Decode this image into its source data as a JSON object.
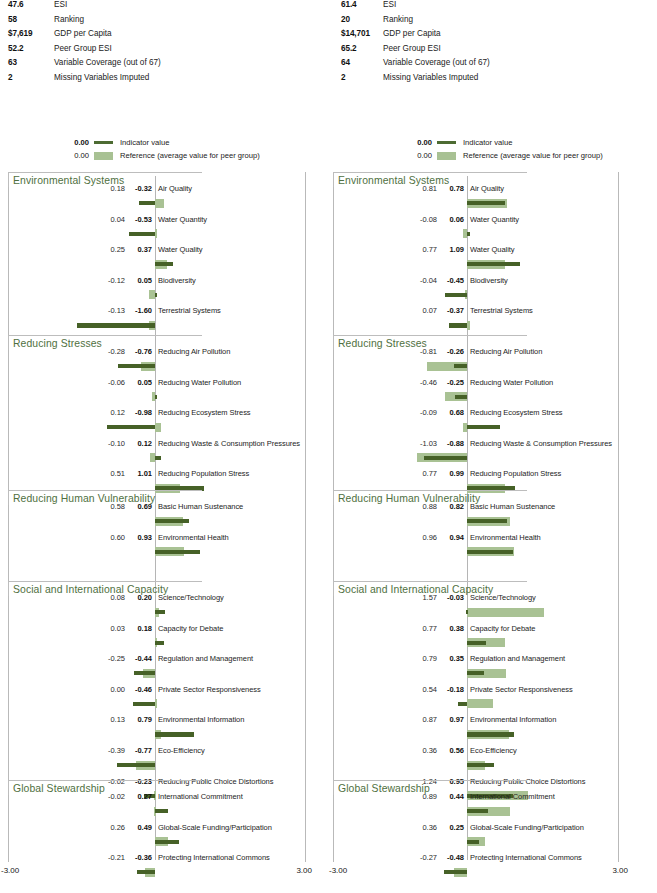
{
  "legend": {
    "indicator": {
      "value": "0.00",
      "label": "Indicator value"
    },
    "reference": {
      "value": "0.00",
      "label": "Reference (average value for peer group)"
    }
  },
  "axis": {
    "min_label": "-3.00",
    "max_label": "3.00",
    "min": -3.0,
    "max": 3.0
  },
  "colors": {
    "indicator": "#466127",
    "reference": "#a9c294",
    "group_title": "#4f7041",
    "rule": "#bdbdbd"
  },
  "panels": [
    {
      "id": "left",
      "stats": [
        {
          "value": "47.6",
          "label": "ESI"
        },
        {
          "value": "58",
          "label": "Ranking"
        },
        {
          "value": "$7,619",
          "label": "GDP per Capita"
        },
        {
          "value": "52.2",
          "label": "Peer Group ESI"
        },
        {
          "value": "63",
          "label": "Variable Coverage (out of 67)"
        },
        {
          "value": "2",
          "label": "Missing Variables Imputed"
        }
      ],
      "chart_data": {
        "type": "bar",
        "title": "",
        "xlabel": "",
        "ylabel": "",
        "xlim": [
          -3.0,
          3.0
        ],
        "grid": false,
        "legend_position": "top-left",
        "series": [
          {
            "name": "Indicator value",
            "color": "#466127"
          },
          {
            "name": "Reference (average value for peer group)",
            "color": "#a9c294"
          }
        ],
        "groups": [
          {
            "name": "Environmental Systems",
            "indicators": [
              {
                "name": "Air Quality",
                "reference": "0.18",
                "value": "-0.32",
                "ref_num": 0.18,
                "val_num": -0.32
              },
              {
                "name": "Water Quantity",
                "reference": "0.04",
                "value": "-0.53",
                "ref_num": 0.04,
                "val_num": -0.53
              },
              {
                "name": "Water Quality",
                "reference": "0.25",
                "value": "0.37",
                "ref_num": 0.25,
                "val_num": 0.37
              },
              {
                "name": "Biodiversity",
                "reference": "-0.12",
                "value": "0.05",
                "ref_num": -0.12,
                "val_num": 0.05
              },
              {
                "name": "Terrestrial Systems",
                "reference": "-0.13",
                "value": "-1.60",
                "ref_num": -0.13,
                "val_num": -1.6
              }
            ]
          },
          {
            "name": "Reducing Stresses",
            "indicators": [
              {
                "name": "Reducing Air Pollution",
                "reference": "-0.28",
                "value": "-0.76",
                "ref_num": -0.28,
                "val_num": -0.76
              },
              {
                "name": "Reducing Water Pollution",
                "reference": "-0.06",
                "value": "0.05",
                "ref_num": -0.06,
                "val_num": 0.05
              },
              {
                "name": "Reducing Ecosystem Stress",
                "reference": "0.12",
                "value": "-0.98",
                "ref_num": 0.12,
                "val_num": -0.98
              },
              {
                "name": "Reducing Waste & Consumption Pressures",
                "reference": "-0.10",
                "value": "0.12",
                "ref_num": -0.1,
                "val_num": 0.12
              },
              {
                "name": "Reducing Population Stress",
                "reference": "0.51",
                "value": "1.01",
                "ref_num": 0.51,
                "val_num": 1.01
              }
            ]
          },
          {
            "name": "Reducing Human Vulnerability",
            "indicators": [
              {
                "name": "Basic Human Sustenance",
                "reference": "0.58",
                "value": "0.69",
                "ref_num": 0.58,
                "val_num": 0.69
              },
              {
                "name": "Environmental Health",
                "reference": "0.60",
                "value": "0.93",
                "ref_num": 0.6,
                "val_num": 0.93
              }
            ]
          },
          {
            "name": "Social and International Capacity",
            "indicators": [
              {
                "name": "Science/Technology",
                "reference": "0.08",
                "value": "0.20",
                "ref_num": 0.08,
                "val_num": 0.2
              },
              {
                "name": "Capacity for Debate",
                "reference": "0.03",
                "value": "0.18",
                "ref_num": 0.03,
                "val_num": 0.18
              },
              {
                "name": "Regulation and Management",
                "reference": "-0.25",
                "value": "-0.44",
                "ref_num": -0.25,
                "val_num": -0.44
              },
              {
                "name": "Private Sector Responsiveness",
                "reference": "0.00",
                "value": "-0.46",
                "ref_num": 0.0,
                "val_num": -0.46
              },
              {
                "name": "Environmental Information",
                "reference": "0.13",
                "value": "0.79",
                "ref_num": 0.13,
                "val_num": 0.79
              },
              {
                "name": "Eco-Efficiency",
                "reference": "-0.39",
                "value": "-0.77",
                "ref_num": -0.39,
                "val_num": -0.77
              },
              {
                "name": "Reducing Public Choice Distortions",
                "reference": "-0.02",
                "value": "-0.23",
                "ref_num": -0.02,
                "val_num": -0.23
              }
            ]
          },
          {
            "name": "Global Stewardship",
            "indicators": [
              {
                "name": "International Commitment",
                "reference": "-0.02",
                "value": "0.27",
                "ref_num": -0.02,
                "val_num": 0.27
              },
              {
                "name": "Global-Scale Funding/Participation",
                "reference": "0.26",
                "value": "0.49",
                "ref_num": 0.26,
                "val_num": 0.49
              },
              {
                "name": "Protecting International Commons",
                "reference": "-0.21",
                "value": "-0.36",
                "ref_num": -0.21,
                "val_num": -0.36
              }
            ]
          }
        ]
      }
    },
    {
      "id": "right",
      "stats": [
        {
          "value": "61.4",
          "label": "ESI"
        },
        {
          "value": "20",
          "label": "Ranking"
        },
        {
          "value": "$14,701",
          "label": "GDP per Capita"
        },
        {
          "value": "65.2",
          "label": "Peer Group ESI"
        },
        {
          "value": "64",
          "label": "Variable Coverage (out of 67)"
        },
        {
          "value": "2",
          "label": "Missing Variables Imputed"
        }
      ],
      "chart_data": {
        "type": "bar",
        "title": "",
        "xlabel": "",
        "ylabel": "",
        "xlim": [
          -3.0,
          3.0
        ],
        "grid": false,
        "legend_position": "top-left",
        "series": [
          {
            "name": "Indicator value",
            "color": "#466127"
          },
          {
            "name": "Reference (average value for peer group)",
            "color": "#a9c294"
          }
        ],
        "groups": [
          {
            "name": "Environmental Systems",
            "indicators": [
              {
                "name": "Air Quality",
                "reference": "0.81",
                "value": "0.78",
                "ref_num": 0.81,
                "val_num": 0.78
              },
              {
                "name": "Water Quantity",
                "reference": "-0.08",
                "value": "0.06",
                "ref_num": -0.08,
                "val_num": 0.06
              },
              {
                "name": "Water Quality",
                "reference": "0.77",
                "value": "1.09",
                "ref_num": 0.77,
                "val_num": 1.09
              },
              {
                "name": "Biodiversity",
                "reference": "-0.04",
                "value": "-0.45",
                "ref_num": -0.04,
                "val_num": -0.45
              },
              {
                "name": "Terrestrial Systems",
                "reference": "0.07",
                "value": "-0.37",
                "ref_num": 0.07,
                "val_num": -0.37
              }
            ]
          },
          {
            "name": "Reducing Stresses",
            "indicators": [
              {
                "name": "Reducing Air Pollution",
                "reference": "-0.81",
                "value": "-0.26",
                "ref_num": -0.81,
                "val_num": -0.26
              },
              {
                "name": "Reducing Water Pollution",
                "reference": "-0.46",
                "value": "-0.25",
                "ref_num": -0.46,
                "val_num": -0.25
              },
              {
                "name": "Reducing Ecosystem Stress",
                "reference": "-0.09",
                "value": "0.68",
                "ref_num": -0.09,
                "val_num": 0.68
              },
              {
                "name": "Reducing Waste & Consumption Pressures",
                "reference": "-1.03",
                "value": "-0.88",
                "ref_num": -1.03,
                "val_num": -0.88
              },
              {
                "name": "Reducing Population Stress",
                "reference": "0.77",
                "value": "0.99",
                "ref_num": 0.77,
                "val_num": 0.99
              }
            ]
          },
          {
            "name": "Reducing Human Vulnerability",
            "indicators": [
              {
                "name": "Basic Human Sustenance",
                "reference": "0.88",
                "value": "0.82",
                "ref_num": 0.88,
                "val_num": 0.82
              },
              {
                "name": "Environmental Health",
                "reference": "0.96",
                "value": "0.94",
                "ref_num": 0.96,
                "val_num": 0.94
              }
            ]
          },
          {
            "name": "Social and International Capacity",
            "indicators": [
              {
                "name": "Science/Technology",
                "reference": "1.57",
                "value": "-0.03",
                "ref_num": 1.57,
                "val_num": -0.03
              },
              {
                "name": "Capacity for Debate",
                "reference": "0.77",
                "value": "0.38",
                "ref_num": 0.77,
                "val_num": 0.38
              },
              {
                "name": "Regulation and Management",
                "reference": "0.79",
                "value": "0.35",
                "ref_num": 0.79,
                "val_num": 0.35
              },
              {
                "name": "Private Sector Responsiveness",
                "reference": "0.54",
                "value": "-0.18",
                "ref_num": 0.54,
                "val_num": -0.18
              },
              {
                "name": "Environmental Information",
                "reference": "0.87",
                "value": "0.97",
                "ref_num": 0.87,
                "val_num": 0.97
              },
              {
                "name": "Eco-Efficiency",
                "reference": "0.36",
                "value": "0.56",
                "ref_num": 0.36,
                "val_num": 0.56
              },
              {
                "name": "Reducing Public Choice Distortions",
                "reference": "1.24",
                "value": "0.95",
                "ref_num": 1.24,
                "val_num": 0.95
              }
            ]
          },
          {
            "name": "Global Stewardship",
            "indicators": [
              {
                "name": "International Commitment",
                "reference": "0.89",
                "value": "0.44",
                "ref_num": 0.89,
                "val_num": 0.44
              },
              {
                "name": "Global-Scale Funding/Participation",
                "reference": "0.36",
                "value": "0.25",
                "ref_num": 0.36,
                "val_num": 0.25
              },
              {
                "name": "Protecting International Commons",
                "reference": "-0.27",
                "value": "-0.48",
                "ref_num": -0.27,
                "val_num": -0.48
              }
            ]
          }
        ]
      }
    }
  ]
}
